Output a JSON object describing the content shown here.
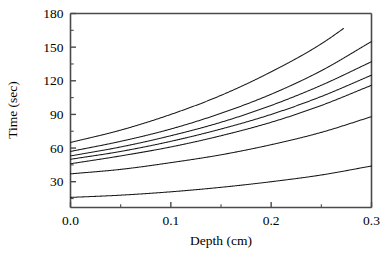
{
  "chart_data": {
    "type": "line",
    "title": "",
    "xlabel": "Depth (cm)",
    "ylabel": "Time (sec)",
    "xlim": [
      0.0,
      0.3
    ],
    "ylim": [
      7,
      180
    ],
    "grid": false,
    "legend": null,
    "xticks": [
      "0.0",
      "0.1",
      "0.2",
      "0.3"
    ],
    "xtick_values": [
      0.0,
      0.1,
      0.2,
      0.3
    ],
    "yticks": [
      "30",
      "60",
      "90",
      "120",
      "150",
      "180"
    ],
    "ytick_values": [
      30,
      60,
      90,
      120,
      150,
      180
    ],
    "x_minor_count": 1,
    "y_minor_count": 1,
    "x": [
      0.0,
      0.05,
      0.1,
      0.15,
      0.2,
      0.25,
      0.3
    ],
    "series": [
      {
        "name": "curve-1",
        "values": [
          65,
          76,
          90,
          107,
          128,
          153,
          185
        ],
        "clipped_at_top": true,
        "clip_x": 0.272
      },
      {
        "name": "curve-2",
        "values": [
          57,
          66,
          77,
          91,
          108,
          129,
          155
        ],
        "clipped_at_top": false,
        "clip_x": 0.3
      },
      {
        "name": "curve-3",
        "values": [
          53,
          61,
          71,
          83,
          98,
          116,
          137
        ],
        "clipped_at_top": false,
        "clip_x": 0.3
      },
      {
        "name": "curve-4",
        "values": [
          50,
          57,
          66,
          77,
          90,
          106,
          125
        ],
        "clipped_at_top": false,
        "clip_x": 0.3
      },
      {
        "name": "curve-5",
        "values": [
          46,
          53,
          61,
          71,
          83,
          98,
          116
        ],
        "clipped_at_top": false,
        "clip_x": 0.3
      },
      {
        "name": "curve-6",
        "values": [
          37,
          41,
          47,
          54,
          63,
          74,
          88
        ],
        "clipped_at_top": false,
        "clip_x": 0.3
      },
      {
        "name": "curve-7",
        "values": [
          16,
          18,
          21,
          25,
          30,
          36,
          44
        ],
        "clipped_at_top": false,
        "clip_x": 0.3
      }
    ]
  },
  "axis_labels": {
    "x_title": "Depth (cm)",
    "y_title": "Time (sec)"
  }
}
